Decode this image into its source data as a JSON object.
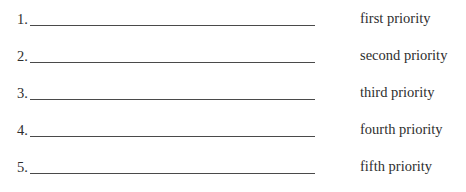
{
  "list": {
    "items": [
      {
        "number": "1.",
        "label": "first priority",
        "value": ""
      },
      {
        "number": "2.",
        "label": "second priority",
        "value": ""
      },
      {
        "number": "3.",
        "label": "third priority",
        "value": ""
      },
      {
        "number": "4.",
        "label": "fourth priority",
        "value": ""
      },
      {
        "number": "5.",
        "label": "fifth priority",
        "value": ""
      }
    ]
  }
}
